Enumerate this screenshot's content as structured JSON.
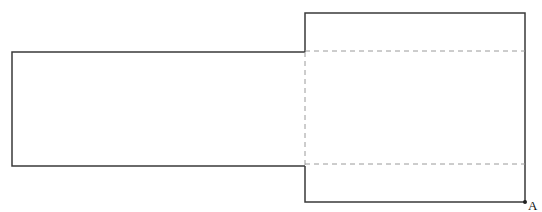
{
  "diagram": {
    "colors": {
      "stroke": "#3a3a3a",
      "dashed": "#9a9a9a",
      "background": "#ffffff"
    },
    "shapes": {
      "left_rect": {
        "x1": 12,
        "y1": 52,
        "x2": 305,
        "y2": 166
      },
      "right_rect": {
        "x1": 305,
        "y1": 13,
        "x2": 525,
        "y2": 202
      },
      "fold_lines": [
        {
          "x1": 305,
          "y1": 52,
          "x2": 525,
          "y2": 52
        },
        {
          "x1": 305,
          "y1": 164,
          "x2": 525,
          "y2": 164
        },
        {
          "x1": 305,
          "y1": 52,
          "x2": 305,
          "y2": 166
        }
      ]
    },
    "points": [
      {
        "label": "A",
        "x": 525,
        "y": 202
      }
    ]
  }
}
